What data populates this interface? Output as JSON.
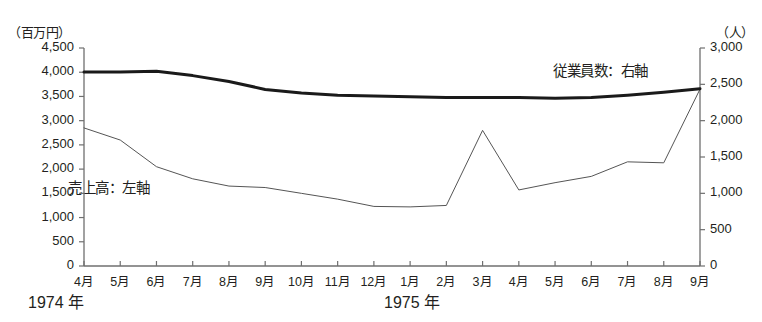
{
  "chart_data": {
    "type": "line",
    "title": "",
    "xlabel": "",
    "grid": false,
    "legend_position": "inline-annotations",
    "categories": [
      "4月",
      "5月",
      "6月",
      "7月",
      "8月",
      "9月",
      "10月",
      "11月",
      "12月",
      "1月",
      "2月",
      "3月",
      "4月",
      "5月",
      "6月",
      "7月",
      "8月",
      "9月"
    ],
    "period_groups": [
      {
        "label": "1974 年",
        "from": "4月",
        "to": "12月"
      },
      {
        "label": "1975 年",
        "from": "1月",
        "to": "9月"
      }
    ],
    "axes": {
      "left": {
        "unit": "（百万円）",
        "ylim": [
          0,
          4500
        ],
        "tick_step": 500,
        "ticks": [
          "4,500",
          "4,000",
          "3,500",
          "3,000",
          "2,500",
          "2,000",
          "1,500",
          "1,000",
          "500",
          "0"
        ]
      },
      "right": {
        "unit": "（人）",
        "ylim": [
          0,
          3000
        ],
        "tick_step": 500,
        "ticks": [
          "3,000",
          "2,500",
          "2,000",
          "1,500",
          "1,000",
          "500",
          "0"
        ]
      }
    },
    "series": [
      {
        "name": "売上高",
        "annotation": "売上高：左軸",
        "axis": "left",
        "unit": "百万円",
        "color": "#555555",
        "line_width": 1,
        "values": [
          2850,
          2600,
          2050,
          1800,
          1650,
          1620,
          1500,
          1380,
          1230,
          1220,
          1250,
          2800,
          1570,
          1720,
          1850,
          2150,
          2130,
          3650
        ]
      },
      {
        "name": "従業員数",
        "annotation": "従業員数：右軸",
        "axis": "right",
        "unit": "人",
        "color": "#1a1a1a",
        "line_width": 3,
        "values": [
          2670,
          2670,
          2680,
          2620,
          2540,
          2430,
          2380,
          2350,
          2340,
          2330,
          2320,
          2320,
          2320,
          2310,
          2320,
          2350,
          2390,
          2440
        ],
        "values_in_left_axis_scale": [
          4005,
          4005,
          4020,
          3930,
          3810,
          3645,
          3570,
          3525,
          3510,
          3495,
          3480,
          3480,
          3480,
          3465,
          3480,
          3525,
          3585,
          3660
        ]
      }
    ]
  }
}
